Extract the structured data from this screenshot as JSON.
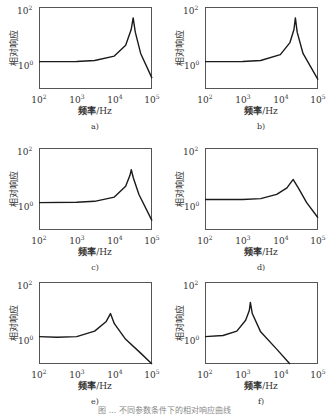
{
  "figure": {
    "caption": "图 ... 不同参数条件下的相对响应曲线",
    "y_axis_label": "相对响应",
    "x_axis_label_cn": "频率",
    "x_axis_label_unit": "/Hz",
    "y_ticks": [
      {
        "base": "10",
        "exp": "2"
      },
      {
        "base": "10",
        "exp": "0"
      }
    ],
    "x_ticks": [
      {
        "base": "10",
        "exp": "2"
      },
      {
        "base": "10",
        "exp": "3"
      },
      {
        "base": "10",
        "exp": "4"
      },
      {
        "base": "10",
        "exp": "5"
      }
    ]
  },
  "chart_data": [
    {
      "type": "line",
      "panel": "a)",
      "title": "a)",
      "xlabel": "频率/Hz",
      "ylabel": "相对响应",
      "xscale": "log",
      "yscale": "log",
      "xlim": [
        100,
        100000
      ],
      "ylim": [
        0.1,
        100
      ],
      "x": [
        100,
        1000,
        3000,
        10000,
        20000,
        28000,
        31600,
        36000,
        50000,
        100000
      ],
      "values": [
        1.0,
        1.02,
        1.1,
        1.6,
        4.0,
        15,
        40,
        12,
        2.0,
        0.25
      ]
    },
    {
      "type": "line",
      "panel": "b)",
      "title": "b)",
      "xlabel": "频率/Hz",
      "ylabel": "相对响应",
      "xscale": "log",
      "yscale": "log",
      "xlim": [
        100,
        100000
      ],
      "ylim": [
        0.1,
        100
      ],
      "x": [
        100,
        1000,
        3000,
        10000,
        18000,
        23000,
        25100,
        28000,
        40000,
        100000
      ],
      "values": [
        1.0,
        1.02,
        1.1,
        1.8,
        5.0,
        15,
        40,
        12,
        2.0,
        0.22
      ]
    },
    {
      "type": "line",
      "panel": "c)",
      "title": "c)",
      "xlabel": "频率/Hz",
      "ylabel": "相对响应",
      "xscale": "log",
      "yscale": "log",
      "xlim": [
        100,
        100000
      ],
      "ylim": [
        0.1,
        100
      ],
      "x": [
        100,
        1000,
        3000,
        10000,
        20000,
        26000,
        28200,
        32000,
        45000,
        100000
      ],
      "values": [
        1.0,
        1.03,
        1.12,
        1.6,
        4.0,
        10,
        16,
        8,
        2.0,
        0.22
      ]
    },
    {
      "type": "line",
      "panel": "d)",
      "title": "d)",
      "xlabel": "频率/Hz",
      "ylabel": "相对响应",
      "xscale": "log",
      "yscale": "log",
      "xlim": [
        100,
        100000
      ],
      "ylim": [
        0.1,
        100
      ],
      "x": [
        100,
        1000,
        3000,
        8000,
        15000,
        20000,
        22000,
        30000,
        50000,
        100000
      ],
      "values": [
        1.3,
        1.3,
        1.4,
        2.0,
        3.5,
        6.0,
        7.0,
        3.5,
        1.0,
        0.28
      ]
    },
    {
      "type": "line",
      "panel": "e)",
      "title": "e)",
      "xlabel": "频率/Hz",
      "ylabel": "相对响应",
      "xscale": "log",
      "yscale": "log",
      "xlim": [
        100,
        100000
      ],
      "ylim": [
        0.1,
        100
      ],
      "x": [
        100,
        300,
        1000,
        3000,
        6000,
        7900,
        10000,
        20000,
        50000,
        100000
      ],
      "values": [
        1.0,
        0.95,
        1.0,
        1.6,
        3.5,
        7.0,
        3.0,
        0.8,
        0.25,
        0.1
      ]
    },
    {
      "type": "line",
      "panel": "f)",
      "title": "f)",
      "xlabel": "频率/Hz",
      "ylabel": "相对响应",
      "xscale": "log",
      "yscale": "log",
      "xlim": [
        100,
        100000
      ],
      "ylim": [
        0.1,
        100
      ],
      "x": [
        100,
        300,
        700,
        1200,
        1500,
        1600,
        1800,
        3000,
        8000,
        18000
      ],
      "values": [
        1.0,
        1.1,
        1.6,
        4.0,
        9.0,
        18,
        7,
        1.5,
        0.35,
        0.1
      ]
    }
  ],
  "panels": [
    {
      "label": "a)",
      "x": 0,
      "y": 0
    },
    {
      "label": "b)",
      "x": 166,
      "y": 0
    },
    {
      "label": "c)",
      "x": 0,
      "y": 141
    },
    {
      "label": "d)",
      "x": 166,
      "y": 141
    },
    {
      "label": "e)",
      "x": 0,
      "y": 275
    },
    {
      "label": "f)",
      "x": 166,
      "y": 275
    }
  ],
  "style": {
    "curve_color": "#1a1a1a",
    "frame_color": "#555555",
    "text_color": "#333333"
  }
}
